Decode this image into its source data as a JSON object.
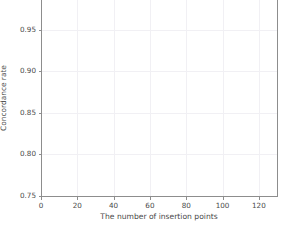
{
  "chart_data": {
    "type": "line",
    "title": "",
    "xlabel": "The number of insertion points",
    "ylabel": "Concordance rate",
    "xlim": [
      0,
      130
    ],
    "ylim": [
      0.75,
      1.0
    ],
    "xticks": [
      0,
      20,
      40,
      60,
      80,
      100,
      120
    ],
    "xticklabels": [
      "0",
      "20",
      "40",
      "60",
      "80",
      "100",
      "120"
    ],
    "yticks": [
      0.75,
      0.8,
      0.85,
      0.9,
      0.95
    ],
    "yticklabels": [
      "0.75",
      "0.80",
      "0.85",
      "0.90",
      "0.95"
    ],
    "grid": true,
    "legend": "none",
    "marker": "square",
    "line_color": "#616161",
    "marker_color": "#4f4f4f",
    "grid_color": "#f1f0f4",
    "spine_color": "#8d8d8d",
    "background": "#ffffff",
    "x": [
      10,
      20,
      30,
      40,
      50,
      60,
      70,
      80,
      90,
      100,
      110,
      120,
      125
    ],
    "values": [
      0.994,
      0.995,
      0.995,
      0.995,
      0.996,
      0.996,
      0.996,
      0.996,
      0.996,
      0.996,
      0.996,
      0.996,
      0.996
    ],
    "series": [
      {
        "name": "Concordance rate",
        "values": [
          0.994,
          0.995,
          0.995,
          0.995,
          0.996,
          0.996,
          0.996,
          0.996,
          0.996,
          0.996,
          0.996,
          0.996,
          0.996
        ]
      }
    ]
  }
}
